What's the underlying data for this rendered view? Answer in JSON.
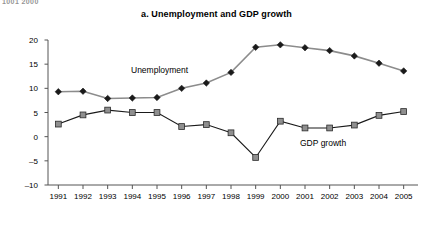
{
  "page": {
    "clipped_header": "1001  2000"
  },
  "chart_data": {
    "type": "line",
    "title": "a. Unemployment and GDP growth",
    "xlabel": "",
    "ylabel": "percentage",
    "categories": [
      "1991",
      "1992",
      "1993",
      "1994",
      "1995",
      "1996",
      "1997",
      "1998",
      "1999",
      "2000",
      "2001",
      "2002",
      "2003",
      "2004",
      "2005"
    ],
    "ylim": [
      -10,
      20
    ],
    "yticks": [
      20,
      15,
      10,
      5,
      0,
      -5,
      -10
    ],
    "ytick_labels": [
      "20",
      "15",
      "10",
      "5",
      "0",
      "-5",
      "-10"
    ],
    "grid": false,
    "legend_position": "inline-annotation",
    "series": [
      {
        "name": "Unemployment",
        "marker": "diamond",
        "color": "#1a1a1a",
        "line_color": "#8c8c8c",
        "values": [
          9.3,
          9.4,
          7.9,
          8.0,
          8.1,
          10.0,
          11.1,
          13.3,
          18.5,
          19.0,
          18.4,
          17.8,
          16.7,
          15.2,
          13.6
        ]
      },
      {
        "name": "GDP growth",
        "marker": "square",
        "color": "#8f8f8f",
        "line_color": "#1a1a1a",
        "values": [
          2.6,
          4.5,
          5.5,
          5.0,
          5.0,
          2.1,
          2.5,
          0.8,
          -4.3,
          3.2,
          1.8,
          1.8,
          2.4,
          4.4,
          5.2
        ]
      }
    ],
    "annotations": [
      {
        "text": "Unemployment",
        "series": "Unemployment"
      },
      {
        "text": "GDP growth",
        "series": "GDP growth"
      }
    ]
  }
}
